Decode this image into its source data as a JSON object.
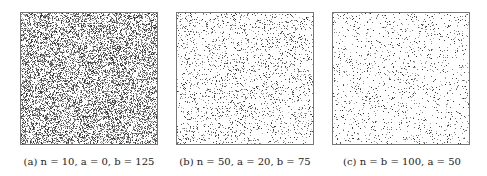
{
  "figure": {
    "panels": [
      {
        "id": "a",
        "caption": "(a) n = 10, a = 0, b = 125",
        "density": 0.42,
        "left": 20
      },
      {
        "id": "b",
        "caption": "(b) n = 50, a = 20, b = 75",
        "density": 0.12,
        "left": 176
      },
      {
        "id": "c",
        "caption": "(c) n = b = 100, a = 50",
        "density": 0.07,
        "left": 332
      }
    ],
    "colors": {
      "dot": "#333333",
      "border": "#777777"
    }
  }
}
